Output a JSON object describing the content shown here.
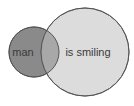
{
  "diagram": {
    "type": "venn",
    "sets": [
      {
        "id": "man",
        "label": "man",
        "cx": 34,
        "cy": 52,
        "r": 25,
        "fill": "#8a8a8a",
        "stroke": "#555555"
      },
      {
        "id": "is-smiling",
        "label": "is smiling",
        "cx": 85,
        "cy": 52,
        "r": 44,
        "fill": "#dcdcdc",
        "stroke": "#6a6a6a"
      }
    ],
    "overlap": {
      "fill": "#a8a8a8"
    },
    "background": "#ffffff"
  }
}
